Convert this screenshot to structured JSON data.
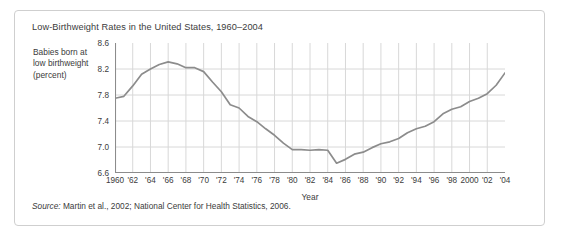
{
  "figure": {
    "title": "Low-Birthweight Rates in the United States, 1960–2004",
    "y_axis_label": "Babies born at low birthweight (percent)",
    "x_axis_label": "Year",
    "source_prefix": "Source:",
    "source_text": " Martin et al., 2002; National Center for Health Statistics, 2006.",
    "line_color": "#8c8c8c",
    "grid_color": "#d8d8d8",
    "axis_color": "#8c8c8c",
    "text_color": "#3b3b3b",
    "border_color": "#cfcfcf"
  },
  "chart_data": {
    "type": "line",
    "title": "Low-Birthweight Rates in the United States, 1960–2004",
    "xlabel": "Year",
    "ylabel": "Babies born at low birthweight (percent)",
    "xlim": [
      1960,
      2004
    ],
    "ylim": [
      6.6,
      8.6
    ],
    "yticks": [
      6.6,
      7.0,
      7.4,
      7.8,
      8.2,
      8.6
    ],
    "ytick_labels": [
      "6.6",
      "7.0",
      "7.4",
      "7.8",
      "8.2",
      "8.6"
    ],
    "xticks": [
      1960,
      1962,
      1964,
      1966,
      1968,
      1970,
      1972,
      1974,
      1976,
      1978,
      1980,
      1982,
      1984,
      1986,
      1988,
      1990,
      1992,
      1994,
      1996,
      1998,
      2000,
      2002,
      2004
    ],
    "xtick_labels": [
      "1960",
      "'62",
      "'64",
      "'66",
      "'68",
      "'70",
      "'72",
      "'74",
      "'76",
      "'78",
      "'80",
      "'82",
      "'84",
      "'86",
      "'88",
      "'90",
      "'92",
      "'94",
      "'96",
      "'98",
      "2000",
      "'02",
      "'04"
    ],
    "grid": true,
    "legend": false,
    "x": [
      1960,
      1961,
      1962,
      1963,
      1964,
      1965,
      1966,
      1967,
      1968,
      1969,
      1970,
      1971,
      1972,
      1973,
      1974,
      1975,
      1976,
      1977,
      1978,
      1979,
      1980,
      1981,
      1982,
      1983,
      1984,
      1985,
      1986,
      1987,
      1988,
      1989,
      1990,
      1991,
      1992,
      1993,
      1994,
      1995,
      1996,
      1997,
      1998,
      1999,
      2000,
      2001,
      2002,
      2003,
      2004
    ],
    "values": [
      7.75,
      7.78,
      7.94,
      8.12,
      8.2,
      8.27,
      8.31,
      8.28,
      8.22,
      8.22,
      8.16,
      8.0,
      7.85,
      7.65,
      7.6,
      7.47,
      7.39,
      7.28,
      7.18,
      7.06,
      6.96,
      6.96,
      6.95,
      6.96,
      6.95,
      6.75,
      6.81,
      6.89,
      6.92,
      6.99,
      7.05,
      7.08,
      7.13,
      7.22,
      7.28,
      7.32,
      7.39,
      7.51,
      7.58,
      7.62,
      7.7,
      7.75,
      7.82,
      7.95,
      8.14
    ],
    "series_label": "Low-birthweight rate"
  }
}
